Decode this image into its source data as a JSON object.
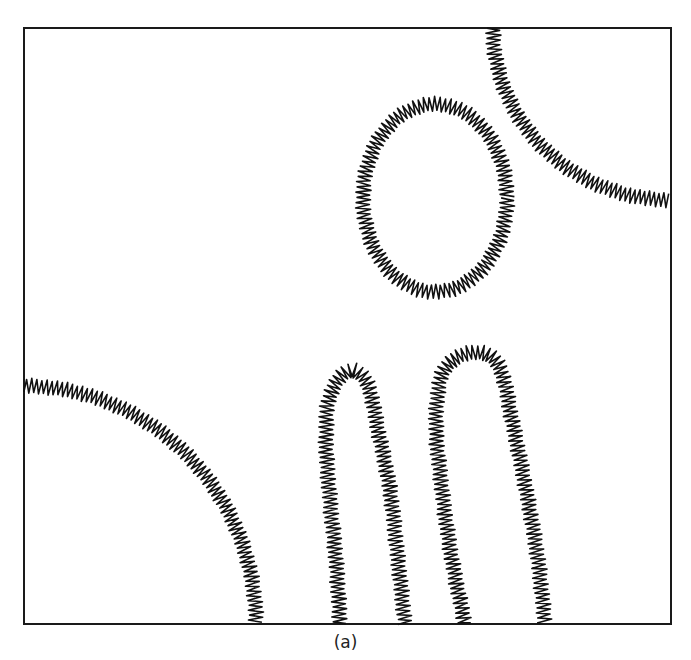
{
  "figure": {
    "caption": "(a)",
    "frame": {
      "x": 24,
      "y": 28,
      "width": 647,
      "height": 596,
      "stroke": "#1a1a1a"
    },
    "ink_color": "#111111",
    "background": "#ffffff",
    "zigzag": {
      "amplitude": 7,
      "wavelength": 5
    },
    "shapes": [
      {
        "id": "corner-arc-top-right",
        "kind": "arc",
        "cx": 671,
        "cy": 28,
        "rx": 178,
        "ry": 172,
        "start_deg": 180,
        "end_deg": 90
      },
      {
        "id": "vesicle-circle",
        "kind": "ellipse",
        "cx": 435,
        "cy": 198,
        "rx": 72,
        "ry": 94
      },
      {
        "id": "corner-arc-bottom-left",
        "kind": "arc",
        "cx": 24,
        "cy": 624,
        "rx": 232,
        "ry": 238,
        "start_deg": 270,
        "end_deg": 360
      },
      {
        "id": "finger-left",
        "kind": "finger",
        "points": [
          [
            340,
            624
          ],
          [
            336,
            560
          ],
          [
            330,
            500
          ],
          [
            326,
            440
          ],
          [
            330,
            395
          ],
          [
            350,
            370
          ],
          [
            368,
            385
          ],
          [
            378,
            430
          ],
          [
            390,
            490
          ],
          [
            398,
            560
          ],
          [
            405,
            624
          ]
        ]
      },
      {
        "id": "finger-right",
        "kind": "finger",
        "points": [
          [
            465,
            624
          ],
          [
            452,
            560
          ],
          [
            442,
            490
          ],
          [
            436,
            420
          ],
          [
            445,
            368
          ],
          [
            478,
            352
          ],
          [
            500,
            368
          ],
          [
            512,
            420
          ],
          [
            528,
            500
          ],
          [
            538,
            560
          ],
          [
            545,
            624
          ]
        ]
      }
    ]
  }
}
